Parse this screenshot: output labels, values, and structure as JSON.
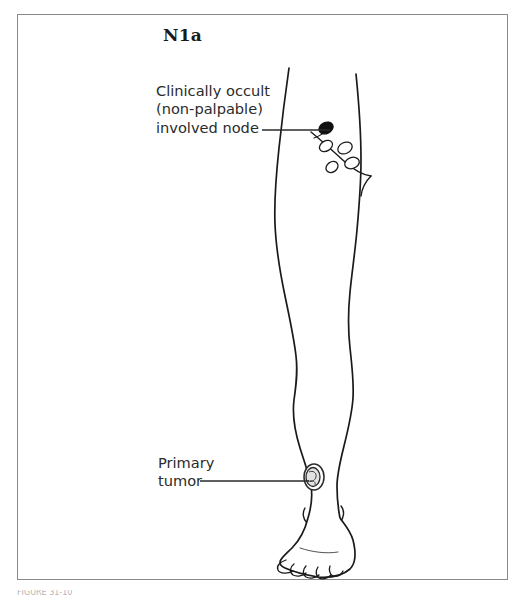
{
  "figure": {
    "stage_title": "N1a",
    "caption_fragment": "FIGURE 31-10",
    "background_color": "#ffffff",
    "frame_color": "#8a8a8a",
    "ink_color": "#1a1a1a",
    "annotation_color": "#2b2b2b"
  },
  "annotations": {
    "node": {
      "line1": "Clinically occult",
      "line2": "(non-palpable)",
      "line3": "involved node"
    },
    "tumor": {
      "line1": "Primary",
      "line2": "tumor"
    }
  },
  "anatomy": {
    "limb_label": "right-lower-limb",
    "foot_label": "foot-with-toes",
    "lymphatic_chain_label": "inguinal-lymphatic-chain"
  },
  "lymph_nodes": {
    "involved": {
      "fill": "#111111",
      "label": "involved-node-filled",
      "cx": 326,
      "cy": 128,
      "rx": 7.5,
      "ry": 5.5,
      "rotation": -28
    },
    "uninvolved": [
      {
        "label": "uninvolved-node-1",
        "cx": 326,
        "cy": 146,
        "rx": 7.0,
        "ry": 5.0,
        "rotation": -30
      },
      {
        "label": "uninvolved-node-2",
        "cx": 345,
        "cy": 148,
        "rx": 7.5,
        "ry": 5.5,
        "rotation": -25
      },
      {
        "label": "uninvolved-node-3",
        "cx": 352,
        "cy": 163,
        "rx": 7.5,
        "ry": 5.5,
        "rotation": -20
      },
      {
        "label": "uninvolved-node-4",
        "cx": 332,
        "cy": 167,
        "rx": 6.5,
        "ry": 5.0,
        "rotation": -35
      }
    ],
    "uninvolved_fill": "#ffffff"
  },
  "primary_tumor": {
    "label": "primary-tumor-lesion",
    "cx": 314,
    "cy": 477,
    "rx": 10,
    "ry": 13,
    "fill": "#e2e2e2",
    "outline": "#2a2a2a"
  },
  "leader_lines": {
    "node_leader": {
      "x1": 262,
      "y1": 130,
      "x2": 330,
      "y2": 130
    },
    "tumor_leader": {
      "x1": 200,
      "y1": 481,
      "x2": 309,
      "y2": 481
    }
  }
}
